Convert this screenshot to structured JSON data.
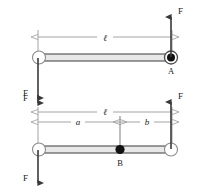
{
  "figure": {
    "background_color": "#ffffff",
    "stroke_color": "#3a3a3a",
    "dim_line_color": "#9a9a9a",
    "bar_fill_color": "#e8e8e8"
  },
  "diagrams": [
    {
      "id": "upper",
      "name": "bar-with-force-couple-at-end-A",
      "bar": {
        "left_joint": "open-circle",
        "right_joint": "filled-circle-in-ring"
      },
      "labels": {
        "length": "ℓ",
        "point": "A",
        "force_up": "F",
        "force_down": "F"
      }
    },
    {
      "id": "lower",
      "name": "bar-with-force-couple-and-interior-point-B",
      "bar": {
        "left_joint": "open-circle",
        "right_joint": "open-circle",
        "interior_point": "filled-circle"
      },
      "labels": {
        "length": "ℓ",
        "segment_left": "a",
        "segment_right": "b",
        "point": "B",
        "force_up": "F",
        "force_down": "F"
      }
    }
  ]
}
